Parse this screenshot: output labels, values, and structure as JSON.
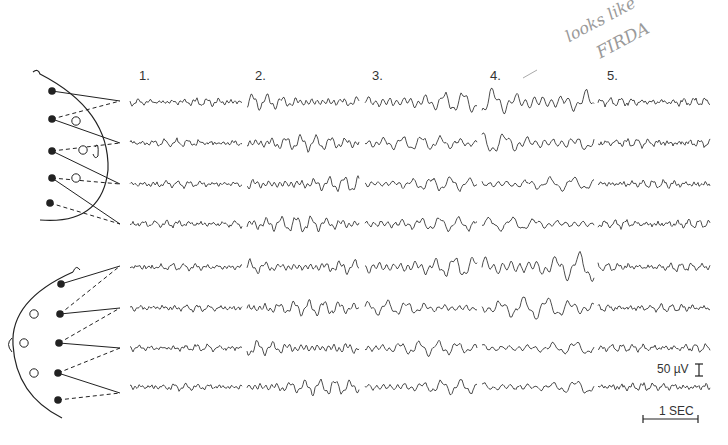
{
  "figure": {
    "type": "EEG montage comparison",
    "columns": [
      {
        "label": "1.",
        "x": 130,
        "amplitude": 3.0,
        "freq": 0.55,
        "style": "low"
      },
      {
        "label": "2.",
        "x": 247,
        "amplitude": 6.5,
        "freq": 0.42,
        "style": "mid"
      },
      {
        "label": "3.",
        "x": 365,
        "amplitude": 8.5,
        "freq": 0.33,
        "style": "slow"
      },
      {
        "label": "4.",
        "x": 482,
        "amplitude": 12.0,
        "freq": 0.27,
        "style": "firda"
      },
      {
        "label": "5.",
        "x": 598,
        "amplitude": 3.5,
        "freq": 0.6,
        "style": "low"
      }
    ],
    "trace_width": 112,
    "rows_top": [
      102,
      143,
      184,
      224
    ],
    "rows_bottom": [
      267,
      308,
      348,
      387
    ],
    "annotation": {
      "line1": "looks like",
      "line2": "FIRDA"
    },
    "scale": {
      "voltage_label": "50 µV",
      "time_label": "1 SEC"
    },
    "colors": {
      "trace": "#3a3a3a",
      "ink": "#222222",
      "annotation": "#9a9a9a"
    }
  }
}
